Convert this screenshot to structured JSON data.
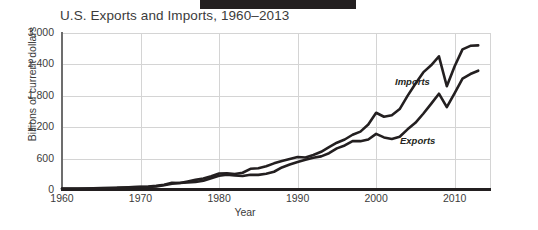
{
  "decoration": {
    "top_bar": "black-redaction-bar"
  },
  "chart_data": {
    "type": "line",
    "title": "U.S. Exports and Imports, 1960–2013",
    "xlabel": "Year",
    "ylabel": "Billions of current dollars",
    "xlim": [
      1960,
      2014.5
    ],
    "ylim": [
      0,
      3000
    ],
    "grid": true,
    "legend_position": "inline-labels",
    "xticks": [
      1960,
      1970,
      1980,
      1990,
      2000,
      2010
    ],
    "xtick_labels": [
      "1960",
      "1970",
      "1980",
      "1990",
      "2000",
      "2010"
    ],
    "yticks": [
      0,
      600,
      1200,
      1800,
      2400,
      3000
    ],
    "ytick_labels": [
      "0",
      "600",
      "1,200",
      "1,800",
      "2,400",
      "3,000"
    ],
    "x": [
      1960,
      1961,
      1962,
      1963,
      1964,
      1965,
      1966,
      1967,
      1968,
      1969,
      1970,
      1971,
      1972,
      1973,
      1974,
      1975,
      1976,
      1977,
      1978,
      1979,
      1980,
      1981,
      1982,
      1983,
      1984,
      1985,
      1986,
      1987,
      1988,
      1989,
      1990,
      1991,
      1992,
      1993,
      1994,
      1995,
      1996,
      1997,
      1998,
      1999,
      2000,
      2001,
      2002,
      2003,
      2004,
      2005,
      2006,
      2007,
      2008,
      2009,
      2010,
      2011,
      2012,
      2013
    ],
    "series": [
      {
        "name": "Imports",
        "color": "#231f20",
        "values": [
          23,
          23,
          25,
          26,
          29,
          32,
          38,
          41,
          48,
          54,
          60,
          66,
          79,
          99,
          138,
          133,
          162,
          194,
          220,
          263,
          314,
          318,
          304,
          329,
          405,
          417,
          453,
          509,
          554,
          591,
          630,
          622,
          669,
          730,
          819,
          903,
          965,
          1056,
          1116,
          1252,
          1476,
          1400,
          1430,
          1546,
          1798,
          2030,
          2247,
          2383,
          2554,
          1983,
          2365,
          2687,
          2755,
          2764
        ]
      },
      {
        "name": "Exports",
        "color": "#231f20",
        "values": [
          26,
          27,
          28,
          30,
          34,
          36,
          39,
          42,
          46,
          50,
          57,
          59,
          67,
          91,
          121,
          133,
          143,
          152,
          178,
          224,
          272,
          291,
          277,
          267,
          291,
          289,
          310,
          349,
          431,
          487,
          536,
          578,
          617,
          643,
          703,
          795,
          852,
          936,
          933,
          966,
          1072,
          1005,
          975,
          1018,
          1159,
          1283,
          1457,
          1646,
          1840,
          1583,
          1853,
          2128,
          2216,
          2280
        ]
      }
    ]
  }
}
